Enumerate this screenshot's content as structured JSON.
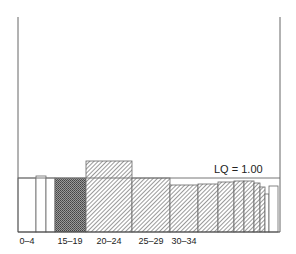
{
  "chart_data": {
    "type": "bar",
    "title": "",
    "xlabel": "",
    "ylabel": "",
    "variable_width": true,
    "reference_line": {
      "label": "LQ = 1.00",
      "value": 1.0
    },
    "ylim": [
      0,
      4.7
    ],
    "x_tick_labels": [
      "0–4",
      "15–19",
      "20–24",
      "25–29",
      "30–34"
    ],
    "bars": [
      {
        "category": "0–4",
        "value": 1.0,
        "fill": "white"
      },
      {
        "category": "5–9",
        "value": 1.04,
        "fill": "white"
      },
      {
        "category": "10–14",
        "value": 1.0,
        "fill": "white"
      },
      {
        "category": "15–19",
        "value": 1.0,
        "fill": "crosshatch-dark"
      },
      {
        "category": "20–24",
        "value": 1.3,
        "fill": "hatched"
      },
      {
        "category": "25–29",
        "value": 1.0,
        "fill": "hatched"
      },
      {
        "category": "30–34",
        "value": 0.87,
        "fill": "hatched"
      },
      {
        "category": "35–39",
        "value": 0.89,
        "fill": "hatched"
      },
      {
        "category": "40–44",
        "value": 0.93,
        "fill": "hatched"
      },
      {
        "category": "45–49",
        "value": 0.94,
        "fill": "hatched"
      },
      {
        "category": "50–54",
        "value": 0.94,
        "fill": "hatched"
      },
      {
        "category": "55–59",
        "value": 0.91,
        "fill": "hatched"
      },
      {
        "category": "60–64",
        "value": 0.83,
        "fill": "hatched"
      },
      {
        "category": "65–69",
        "value": 0.7,
        "fill": "white"
      },
      {
        "category": "70+",
        "value": 0.85,
        "fill": "white"
      }
    ],
    "grid": false,
    "legend": null
  },
  "geometry": {
    "frame": {
      "left": 18,
      "right": 280,
      "top": 17,
      "bottom": 232
    },
    "lq_line_y": 178,
    "bars_px": [
      {
        "x0": 18,
        "x1": 36,
        "top": 178
      },
      {
        "x0": 36,
        "x1": 46,
        "top": 176
      },
      {
        "x0": 46,
        "x1": 55,
        "top": 178
      },
      {
        "x0": 55,
        "x1": 86,
        "top": 178
      },
      {
        "x0": 86,
        "x1": 132,
        "top": 161
      },
      {
        "x0": 132,
        "x1": 170,
        "top": 178
      },
      {
        "x0": 170,
        "x1": 198,
        "top": 185
      },
      {
        "x0": 198,
        "x1": 218,
        "top": 184
      },
      {
        "x0": 218,
        "x1": 234,
        "top": 182
      },
      {
        "x0": 234,
        "x1": 244,
        "top": 181
      },
      {
        "x0": 244,
        "x1": 254,
        "top": 181
      },
      {
        "x0": 254,
        "x1": 260,
        "top": 183
      },
      {
        "x0": 260,
        "x1": 265,
        "top": 187
      },
      {
        "x0": 265,
        "x1": 269,
        "top": 194
      },
      {
        "x0": 269,
        "x1": 278,
        "top": 186
      }
    ],
    "tick_label_x": [
      27,
      70,
      109,
      151,
      184
    ]
  }
}
